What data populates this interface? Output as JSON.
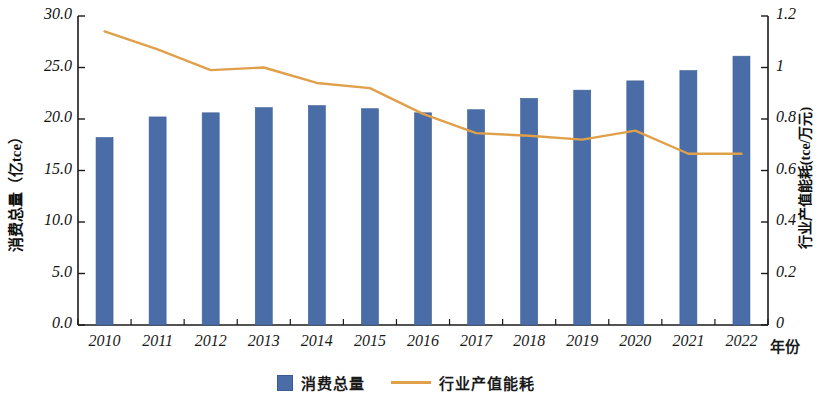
{
  "chart_data": {
    "type": "bar",
    "title": "",
    "xlabel": "年份",
    "categories": [
      "2010",
      "2011",
      "2012",
      "2013",
      "2014",
      "2015",
      "2016",
      "2017",
      "2018",
      "2019",
      "2020",
      "2021",
      "2022"
    ],
    "grid": false,
    "legend_position": "bottom",
    "series": [
      {
        "name": "消费总量",
        "type": "bar",
        "axis": "left",
        "unit": "亿tce",
        "color": "#4a6da7",
        "values": [
          18.2,
          20.2,
          20.6,
          21.1,
          21.3,
          21.0,
          20.6,
          20.9,
          22.0,
          22.8,
          23.7,
          24.7,
          26.1
        ]
      },
      {
        "name": "行业产值能耗",
        "type": "line",
        "axis": "right",
        "unit": "tce/万元",
        "color": "#e0a04a",
        "values": [
          1.14,
          1.07,
          0.99,
          1.0,
          0.94,
          0.92,
          0.82,
          0.745,
          0.735,
          0.72,
          0.755,
          0.665,
          0.665
        ]
      }
    ],
    "left_axis": {
      "label": "消费总量（亿tce）",
      "min": 0.0,
      "max": 30.0,
      "tick_labels": [
        "30.0",
        "25.0",
        "20.0",
        "15.0",
        "10.0",
        "5.0",
        "0.0"
      ],
      "tick_values": [
        30.0,
        25.0,
        20.0,
        15.0,
        10.0,
        5.0,
        0.0
      ]
    },
    "right_axis": {
      "label": "行业产值能耗(tce/万元)",
      "min": 0,
      "max": 1.2,
      "tick_labels": [
        "1.2",
        "1",
        "0.8",
        "0.6",
        "0.4",
        "0.2",
        "0"
      ],
      "tick_values": [
        1.2,
        1,
        0.8,
        0.6,
        0.4,
        0.2,
        0
      ]
    },
    "legend": [
      {
        "label": "消费总量",
        "marker": "square",
        "color": "#4a6da7"
      },
      {
        "label": "行业产值能耗",
        "marker": "line",
        "color": "#e0a04a"
      }
    ]
  }
}
